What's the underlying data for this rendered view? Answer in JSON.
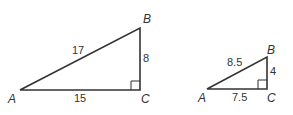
{
  "triangles": [
    {
      "name": "large",
      "vertices": {
        "A": "A",
        "B": "B",
        "C": "C"
      },
      "sides": {
        "AB": "17",
        "BC": "8",
        "AC": "15"
      },
      "right_angle_at": "C"
    },
    {
      "name": "small",
      "vertices": {
        "A": "A",
        "B": "B",
        "C": "C"
      },
      "sides": {
        "AB": "8.5",
        "BC": "4",
        "AC": "7.5"
      },
      "right_angle_at": "C"
    }
  ],
  "colors": {
    "stroke": "#333333",
    "background": "#ffffff"
  }
}
